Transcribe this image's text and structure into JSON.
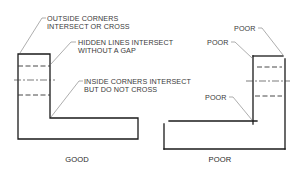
{
  "diagram": {
    "good_figure": {
      "caption": "GOOD",
      "annotations": [
        {
          "line1": "OUTSIDE CORNERS",
          "line2": "INTERSECT OR CROSS"
        },
        {
          "line1": "HIDDEN LINES INTERSECT",
          "line2": "WITHOUT A GAP"
        },
        {
          "line1": "INSIDE CORNERS INTERSECT",
          "line2": "BUT DO NOT CROSS"
        }
      ]
    },
    "poor_figure": {
      "caption": "POOR",
      "annotations": [
        {
          "label": "POOR"
        },
        {
          "label": "POOR"
        },
        {
          "label": "POOR"
        }
      ]
    },
    "colors": {
      "background": "#ffffff",
      "object_line": "#1a1a1a",
      "leader_line": "#777777",
      "text": "#3a3a3a"
    }
  }
}
